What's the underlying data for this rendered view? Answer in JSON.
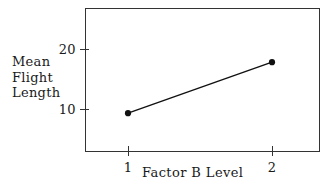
{
  "chart_data": {
    "type": "line",
    "title": "",
    "subtitle": "",
    "xlabel": "Factor B Level",
    "ylabel": "Mean Flight Length",
    "ylabel_lines": [
      "Mean",
      "Flight",
      "Length"
    ],
    "categories": [
      "1",
      "2"
    ],
    "x": [
      1,
      2
    ],
    "values": [
      9.3,
      17.8
    ],
    "series": [
      {
        "name": "Mean Flight Length",
        "values": [
          9.3,
          17.8
        ],
        "marker": "filled-circle",
        "color": "#111111"
      }
    ],
    "xticks": [
      "1",
      "2"
    ],
    "yticks": [
      "10",
      "20"
    ],
    "ytick_values": [
      10,
      20
    ],
    "xlim": [
      0.55,
      2.55
    ],
    "ylim": [
      2.0,
      26.0
    ],
    "grid": false,
    "legend": "none",
    "frame": "box",
    "line_color": "#111111",
    "frame_color": "#333333",
    "background": "#ffffff"
  },
  "axis": {
    "y_tick_20": "20",
    "y_tick_10": "10",
    "x_tick_1": "1",
    "x_tick_2": "2"
  },
  "labels": {
    "ylabel_line1": "Mean",
    "ylabel_line2": "Flight",
    "ylabel_line3": "Length",
    "xlabel": "Factor B Level"
  }
}
